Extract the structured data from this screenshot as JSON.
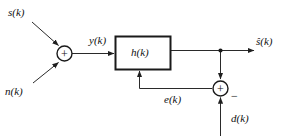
{
  "diagram": {
    "type": "signal-flow-block-diagram",
    "stroke_color": "#222222",
    "block_border_color": "#1a1a1a",
    "background_color": "#ffffff",
    "signals": {
      "input_signal": "s(k)",
      "input_noise": "n(k)",
      "sum_output": "y(k)",
      "filter_output": "ŝ(k)",
      "filter_output_plain": "s(k)",
      "error": "e(k)",
      "desired": "d(k)"
    },
    "blocks": [
      {
        "id": "filter",
        "label": "h(k)"
      }
    ],
    "junctions": [
      {
        "id": "adder-left",
        "symbol": "+",
        "signs": [
          "+",
          "+"
        ]
      },
      {
        "id": "adder-right",
        "symbol": "+",
        "signs": [
          "+",
          "−"
        ]
      }
    ],
    "sign_labels": {
      "minus": "−"
    }
  }
}
